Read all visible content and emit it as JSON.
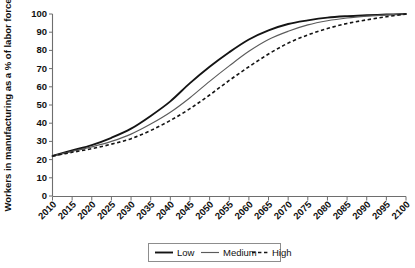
{
  "chart_data": {
    "type": "line",
    "title": "",
    "xlabel": "",
    "ylabel": "Workers in manufacturing as a % of labor force",
    "xlim": [
      2010,
      2100
    ],
    "ylim": [
      0,
      100
    ],
    "grid": false,
    "legend_position": "bottom-center",
    "x": [
      2010,
      2015,
      2020,
      2025,
      2030,
      2035,
      2040,
      2045,
      2050,
      2055,
      2060,
      2065,
      2070,
      2075,
      2080,
      2085,
      2090,
      2095,
      2100
    ],
    "xticklabels": [
      "2010",
      "2015",
      "2020",
      "2025",
      "2030",
      "2035",
      "2040",
      "2045",
      "2050",
      "2055",
      "2060",
      "2065",
      "2070",
      "2075",
      "2080",
      "2085",
      "2090",
      "2095",
      "2100"
    ],
    "yticks": [
      0,
      10,
      20,
      30,
      40,
      50,
      60,
      70,
      80,
      90,
      100
    ],
    "yticklabels": [
      "0",
      "10",
      "20",
      "30",
      "40",
      "50",
      "60",
      "70",
      "80",
      "90",
      "100"
    ],
    "series": [
      {
        "name": "Low",
        "style": "solid-thick",
        "color": "#141414",
        "values": [
          22,
          25,
          28,
          32,
          37,
          44,
          52,
          62,
          71,
          79,
          86,
          91,
          94.5,
          96.5,
          98,
          98.8,
          99.3,
          99.7,
          100
        ]
      },
      {
        "name": "Medium",
        "style": "solid-thin",
        "color": "#5b5b5b",
        "values": [
          22,
          24.5,
          27,
          30,
          34,
          39.5,
          46,
          54,
          63,
          71.5,
          79.5,
          86,
          90.5,
          94,
          96.3,
          97.8,
          98.8,
          99.5,
          100
        ]
      },
      {
        "name": "High",
        "style": "dashed",
        "color": "#141414",
        "values": [
          22,
          24,
          26,
          28.5,
          31.5,
          36,
          41.5,
          48,
          55.5,
          63.5,
          71,
          78,
          84,
          88.5,
          92,
          94.8,
          96.8,
          98.5,
          100
        ]
      }
    ]
  },
  "legend": {
    "items": [
      {
        "label": "Low"
      },
      {
        "label": "Medium"
      },
      {
        "label": "High"
      }
    ]
  }
}
